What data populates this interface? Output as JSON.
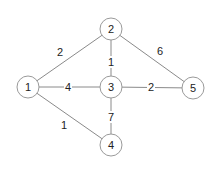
{
  "graph": {
    "nodes": [
      {
        "id": "1",
        "label": "1",
        "x": 28,
        "y": 87
      },
      {
        "id": "2",
        "label": "2",
        "x": 111,
        "y": 29
      },
      {
        "id": "3",
        "label": "3",
        "x": 111,
        "y": 87
      },
      {
        "id": "4",
        "label": "4",
        "x": 111,
        "y": 145
      },
      {
        "id": "5",
        "label": "5",
        "x": 193,
        "y": 88
      }
    ],
    "edges": [
      {
        "from": "1",
        "to": "2",
        "weight": "2",
        "lx": 60,
        "ly": 52
      },
      {
        "from": "2",
        "to": "5",
        "weight": "6",
        "lx": 160,
        "ly": 51
      },
      {
        "from": "2",
        "to": "3",
        "weight": "1",
        "lx": 111,
        "ly": 62
      },
      {
        "from": "1",
        "to": "3",
        "weight": "4",
        "lx": 68,
        "ly": 87
      },
      {
        "from": "3",
        "to": "5",
        "weight": "2",
        "lx": 151,
        "ly": 87
      },
      {
        "from": "3",
        "to": "4",
        "weight": "7",
        "lx": 111,
        "ly": 117
      },
      {
        "from": "1",
        "to": "4",
        "weight": "1",
        "lx": 64,
        "ly": 125
      }
    ],
    "node_radius": 11
  }
}
